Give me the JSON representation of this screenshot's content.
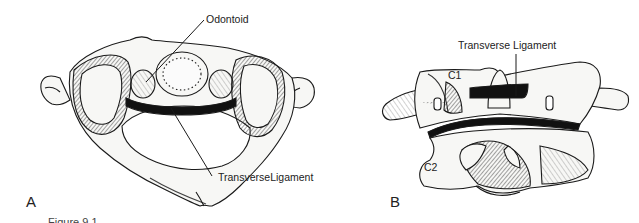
{
  "figure": {
    "panel_a": {
      "letter": "A",
      "labels": {
        "odontoid": "Odontoid",
        "transverse_ligament": "TransverseLigament"
      }
    },
    "panel_b": {
      "letter": "B",
      "labels": {
        "transverse_ligament": "Transverse Ligament",
        "c1": "C1",
        "c2": "C2"
      }
    },
    "caption": "Figure 9.1"
  },
  "colors": {
    "ink": "#1a1a1a",
    "bone_fill": "#f7f7f5",
    "shade": "#555555",
    "ligament": "#111111",
    "background": "#ffffff"
  }
}
